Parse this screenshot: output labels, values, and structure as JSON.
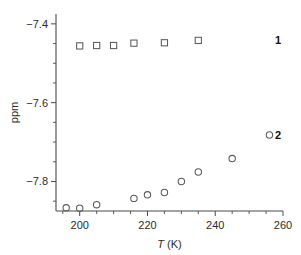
{
  "chart_data": {
    "type": "scatter",
    "title": "",
    "xlabel": "T (K)",
    "ylabel": "ppm",
    "xlim": [
      193,
      260
    ],
    "ylim": [
      -7.875,
      -7.375
    ],
    "grid": false,
    "legend_position": "right-inline",
    "x_ticks": [
      200,
      220,
      240,
      260
    ],
    "x_ticklabels": [
      "200",
      "220",
      "240",
      "260"
    ],
    "x_minor_step": 5,
    "y_ticks": [
      -7.4,
      -7.6,
      -7.8
    ],
    "y_ticklabels": [
      "−7.4",
      "−7.6",
      "−7.8"
    ],
    "y_minor_step": 0.05,
    "series": [
      {
        "name": "1",
        "label": "1",
        "marker": "square",
        "color": "#5a5a5a",
        "x": [
          200,
          205,
          210,
          216,
          225,
          235
        ],
        "y": [
          -7.456,
          -7.455,
          -7.455,
          -7.449,
          -7.448,
          -7.442
        ]
      },
      {
        "name": "2",
        "label": "2",
        "marker": "circle",
        "color": "#5a5a5a",
        "x": [
          196,
          200,
          205,
          216,
          220,
          225,
          230,
          235,
          245,
          256
        ],
        "y": [
          -7.867,
          -7.868,
          -7.859,
          -7.843,
          -7.834,
          -7.828,
          -7.8,
          -7.776,
          -7.742,
          -7.682
        ]
      }
    ]
  }
}
